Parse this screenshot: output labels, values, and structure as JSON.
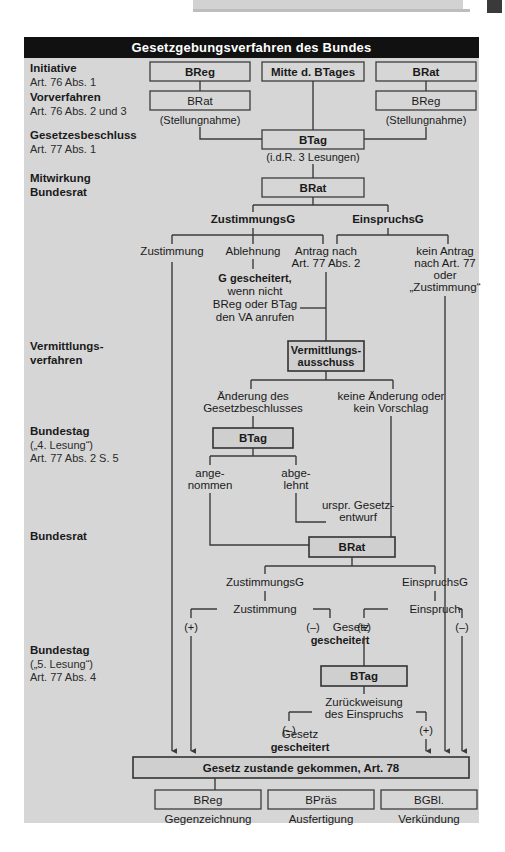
{
  "page": {
    "title": "Gesetzgebungsverfahren des Bundes",
    "header_strip_text": ""
  },
  "stages": [
    {
      "heading": "Initiative",
      "sub1": "Art. 76 Abs. 1",
      "sub2": ""
    },
    {
      "heading": "Vorverfahren",
      "sub1": "Art. 76 Abs. 2 und 3",
      "sub2": ""
    },
    {
      "heading": "Gesetzesbeschluss",
      "sub1": "Art. 77 Abs. 1",
      "sub2": ""
    },
    {
      "heading": "Mitwirkung",
      "sub1": "Bundesrat",
      "sub2": "",
      "bold_sub": true
    },
    {
      "heading": "Vermittlungs-",
      "sub1": "verfahren",
      "sub2": "",
      "bold_sub": true
    },
    {
      "heading": "Bundestag",
      "sub1": "(„4. Lesung“)",
      "sub2": "Art. 77 Abs. 2 S. 5"
    },
    {
      "heading": "Bundesrat",
      "sub1": "",
      "sub2": ""
    },
    {
      "heading": "Bundestag",
      "sub1": "(„5. Lesung“)",
      "sub2": "Art. 77 Abs. 4"
    }
  ],
  "boxes": {
    "breg_init": "BReg",
    "mitte_btages": "Mitte d. BTages",
    "brat_init": "BRat",
    "brat_vor": "BRat",
    "breg_vor": "BReg",
    "btag_beschluss": "BTag",
    "brat_mitwirkung": "BRat",
    "vermittlungsausschuss_l1": "Vermittlungs-",
    "vermittlungsausschuss_l2": "ausschuss",
    "btag_vierte": "BTag",
    "brat_zweite": "BRat",
    "btag_fuenfte": "BTag",
    "gesetz_zustande": "Gesetz zustande gekommen, Art. 78",
    "breg_final": "BReg",
    "bpraes_final": "BPräs",
    "bgbl_final": "BGBl."
  },
  "annotations": {
    "stellungnahme_left": "(Stellungnahme)",
    "stellungnahme_right": "(Stellungnahme)",
    "lesungen": "(i.d.R. 3 Lesungen)",
    "zustimmungsg_1": "ZustimmungsG",
    "einspruchsg_1": "EinspruchsG",
    "zustimmung_1": "Zustimmung",
    "ablehnung": "Ablehnung",
    "antrag_nach_l1": "Antrag nach",
    "antrag_nach_l2": "Art. 77 Abs. 2",
    "kein_antrag_l1": "kein Antrag",
    "kein_antrag_l2": "nach Art. 77",
    "kein_antrag_l3": "oder",
    "kein_antrag_l4": "„Zustimmung“",
    "gescheitert_l1": "G gescheitert,",
    "gescheitert_l2": "wenn nicht",
    "gescheitert_l3": "BReg oder BTag",
    "gescheitert_l4": "den VA anrufen",
    "aenderung_l1": "Änderung des",
    "aenderung_l2": "Gesetzbeschlusses",
    "keine_aenderung_l1": "keine Änderung oder",
    "keine_aenderung_l2": "kein Vorschlag",
    "angenommen_l1": "ange-",
    "angenommen_l2": "nommen",
    "abgelehnt_l1": "abge-",
    "abgelehnt_l2": "lehnt",
    "urspr_entwurf_l1": "urspr. Gesetz-",
    "urspr_entwurf_l2": "entwurf",
    "zustimmungsg_2": "ZustimmungsG",
    "einspruchsg_2": "EinspruchsG",
    "zustimmung_2": "Zustimmung",
    "einspruch": "Einspruch",
    "plus_a": "(+)",
    "minus_a": "(–)",
    "plus_b": "(+)",
    "minus_b": "(–)",
    "gesetz_gescheitert_1_l1": "Gesetz",
    "gesetz_gescheitert_1_l2": "gescheitert",
    "zurueckweisung_l1": "Zurückweisung",
    "zurueckweisung_l2": "des Einspruchs",
    "minus_c": "(–)",
    "plus_c": "(+)",
    "gesetz_gescheitert_2_l1": "Gesetz",
    "gesetz_gescheitert_2_l2": "gescheitert",
    "gegenzeichnung": "Gegenzeichnung",
    "ausfertigung": "Ausfertigung",
    "verkuendung": "Verkündung"
  },
  "colors": {
    "panel_bg": "#d6d6d6",
    "title_bg": "#111111",
    "title_fg": "#ffffff",
    "stroke": "#3c3c3c",
    "text": "#1a1a1a"
  }
}
